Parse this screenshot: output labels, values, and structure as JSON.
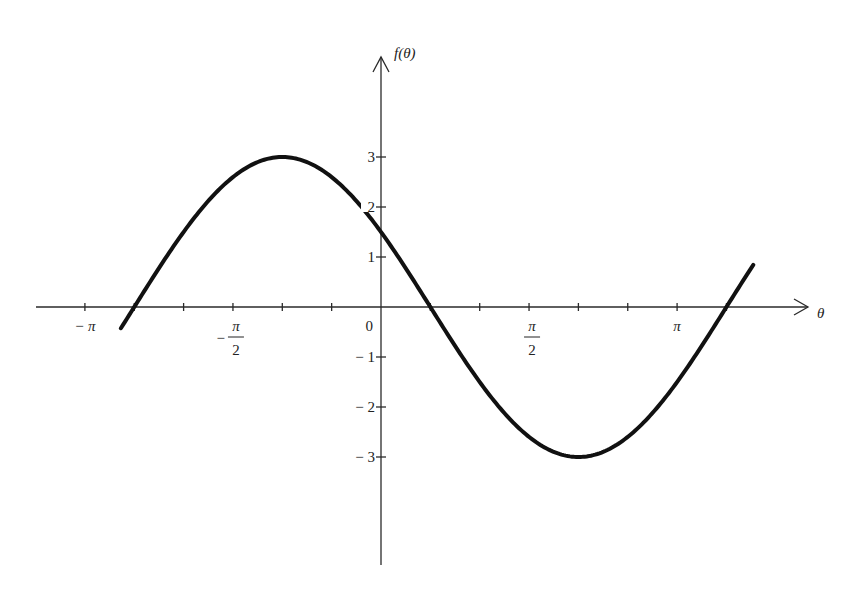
{
  "chart_data": {
    "type": "line",
    "title": "",
    "xlabel": "θ",
    "ylabel": "f(θ)",
    "function": "f(θ) = 3 sin(θ + 5π/6)",
    "xlim": [
      -3.6,
      4.6
    ],
    "ylim": [
      -5.2,
      4.8
    ],
    "x_domain_plotted": [
      -2.76,
      3.95
    ],
    "grid": false,
    "legend": null,
    "x_ticks": {
      "step_radians": 0.5236,
      "labeled": [
        {
          "value": -3.1416,
          "label": "−π",
          "kind": "pi"
        },
        {
          "value": -1.5708,
          "label": "−π/2",
          "kind": "frac",
          "sign": "−",
          "num": "π",
          "den": "2"
        },
        {
          "value": 0,
          "label": "0",
          "kind": "plain"
        },
        {
          "value": 1.5708,
          "label": "π/2",
          "kind": "frac",
          "sign": "",
          "num": "π",
          "den": "2"
        },
        {
          "value": 3.1416,
          "label": "π",
          "kind": "pi"
        }
      ]
    },
    "y_ticks": [
      {
        "value": 3,
        "label": "3"
      },
      {
        "value": 2,
        "label": "2"
      },
      {
        "value": 1,
        "label": "1"
      },
      {
        "value": -1,
        "label": "− 1"
      },
      {
        "value": -2,
        "label": "− 2"
      },
      {
        "value": -3,
        "label": "− 3"
      }
    ],
    "key_points": [
      {
        "name": "left-end",
        "x": -2.76,
        "y": -0.38
      },
      {
        "name": "zero-crossing-1",
        "x": -2.618,
        "y": 0
      },
      {
        "name": "maximum",
        "x": -1.047,
        "y": 3
      },
      {
        "name": "y-intercept",
        "x": 0,
        "y": 1.5
      },
      {
        "name": "zero-crossing-2",
        "x": 0.5236,
        "y": 0
      },
      {
        "name": "minimum",
        "x": 2.094,
        "y": -3
      },
      {
        "name": "zero-crossing-3",
        "x": 3.665,
        "y": 0
      },
      {
        "name": "right-end",
        "x": 3.95,
        "y": 0.84
      }
    ]
  },
  "labels": {
    "y_axis": "f(θ)",
    "x_axis": "θ"
  }
}
